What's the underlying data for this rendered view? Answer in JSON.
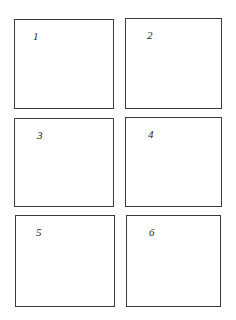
{
  "panels": [
    {
      "label": "1"
    },
    {
      "label": "2"
    },
    {
      "label": "3"
    },
    {
      "label": "4"
    },
    {
      "label": "5"
    },
    {
      "label": "6"
    }
  ],
  "colors": {
    "border": "#3a3a3a",
    "background": "#ffffff",
    "text": "#222222"
  }
}
